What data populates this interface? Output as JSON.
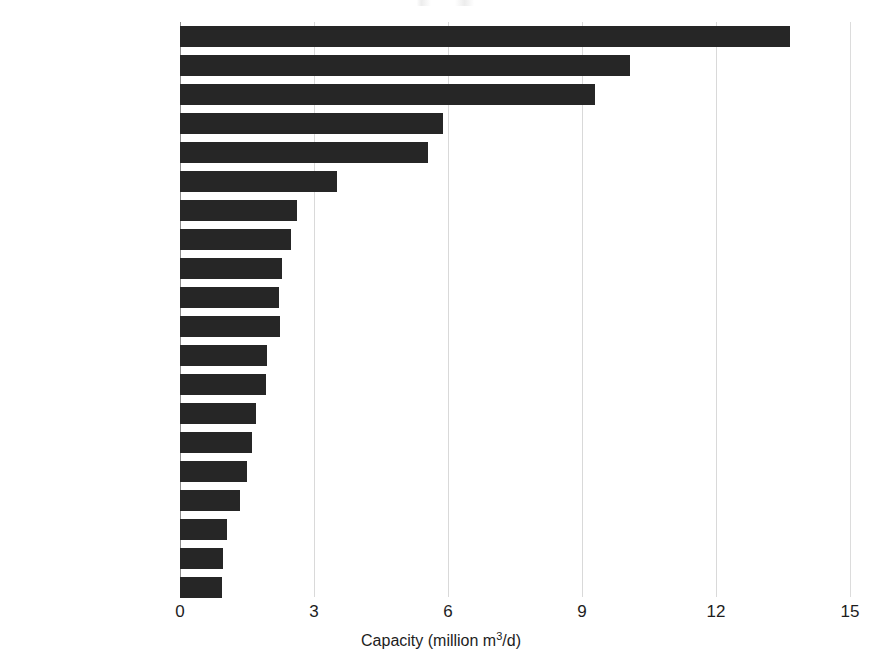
{
  "chart_data": {
    "type": "bar",
    "orientation": "horizontal",
    "title": "",
    "xlabel": "Capacity (million m³/d)",
    "ylabel": "",
    "xlim": [
      0,
      15
    ],
    "xticks": [
      "0",
      "3",
      "6",
      "9",
      "12",
      "15"
    ],
    "xtick_values": [
      0,
      3,
      6,
      9,
      12,
      15
    ],
    "grid": "vertical",
    "legend": "none",
    "bar_color": "#262626",
    "gridline_color": "#d9d9d9",
    "axis_color": "#8c8c8c",
    "categories": [
      "Saudi Arabia",
      "U.S.A.",
      "United Arab Emirates",
      "China",
      "Spain",
      "Kuwait",
      "Algeria",
      "Qatar",
      "Australia",
      "India",
      "Israel",
      "South Korea",
      "Oman",
      "Singapore",
      "Brazil",
      "Egypt",
      "Japan",
      "Bahrain",
      "Iran",
      "Libya"
    ],
    "values": [
      13.66,
      10.07,
      9.29,
      5.89,
      5.55,
      3.51,
      2.62,
      2.48,
      2.28,
      2.22,
      2.24,
      1.95,
      1.93,
      1.7,
      1.62,
      1.5,
      1.35,
      1.05,
      0.96,
      0.94
    ],
    "units": "million m3/d"
  },
  "axis": {
    "x_title_main": "Capacity (million m",
    "x_title_sup": "3",
    "x_title_tail": "/d)"
  }
}
